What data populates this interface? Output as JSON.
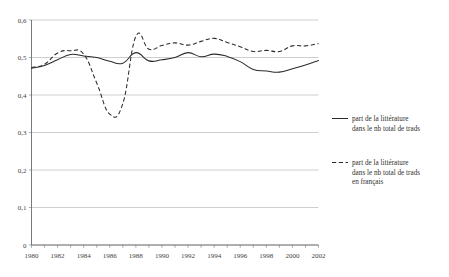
{
  "chart_data": {
    "type": "line",
    "title": "",
    "subtitle": "",
    "xlabel": "",
    "ylabel": "",
    "xlim": [
      1980,
      2002
    ],
    "ylim": [
      0,
      0.6
    ],
    "grid": true,
    "legend_position": "right",
    "x": [
      1980,
      1981,
      1982,
      1983,
      1984,
      1985,
      1986,
      1987,
      1988,
      1989,
      1990,
      1991,
      1992,
      1993,
      1994,
      1995,
      1996,
      1997,
      1998,
      1999,
      2000,
      2001,
      2002
    ],
    "ytick_labels": [
      "0",
      "0,1",
      "0,2",
      "0,3",
      "0,4",
      "0,5",
      "0,6"
    ],
    "ytick_values": [
      0,
      0.1,
      0.2,
      0.3,
      0.4,
      0.5,
      0.6
    ],
    "xtick_labels": [
      "1980",
      "1982",
      "1984",
      "1986",
      "1988",
      "1990",
      "1992",
      "1994",
      "1996",
      "1998",
      "2000",
      "2002"
    ],
    "xtick_values": [
      1980,
      1982,
      1984,
      1986,
      1988,
      1990,
      1992,
      1994,
      1996,
      1998,
      2000,
      2002
    ],
    "series": [
      {
        "name": "part de la littérature dans le nb total de trads",
        "style": "solid",
        "color": "#2b2b2b",
        "values": [
          0.471,
          0.479,
          0.494,
          0.508,
          0.504,
          0.5,
          0.49,
          0.485,
          0.513,
          0.491,
          0.494,
          0.5,
          0.513,
          0.502,
          0.509,
          0.503,
          0.489,
          0.468,
          0.464,
          0.461,
          0.47,
          0.48,
          0.492
        ]
      },
      {
        "name": "part de la littérature dans le nb total de trads en français",
        "style": "dashed",
        "color": "#2b2b2b",
        "values": [
          0.474,
          0.482,
          0.512,
          0.518,
          0.509,
          0.432,
          0.349,
          0.377,
          0.556,
          0.522,
          0.532,
          0.539,
          0.533,
          0.543,
          0.551,
          0.54,
          0.529,
          0.516,
          0.519,
          0.516,
          0.531,
          0.531,
          0.537
        ]
      }
    ],
    "legend_entries": [
      {
        "style": "solid",
        "lines": [
          "part de la littérature",
          "dans le nb total de trads"
        ]
      },
      {
        "style": "dashed",
        "lines": [
          "part de la littérature",
          "dans le nb total de trads",
          "en français"
        ]
      }
    ]
  }
}
